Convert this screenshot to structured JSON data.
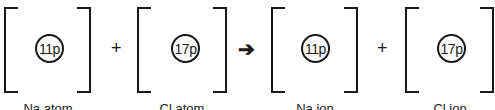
{
  "diagram": {
    "species": [
      {
        "id": "na-atom",
        "nucleus": "11p",
        "label": "Na atom"
      },
      {
        "id": "cl-atom",
        "nucleus": "17p",
        "label": "Cl atom"
      },
      {
        "id": "na-ion",
        "nucleus": "11p",
        "label": "Na ion"
      },
      {
        "id": "cl-ion",
        "nucleus": "17p",
        "label": "Cl ion"
      }
    ],
    "operators": {
      "plus": "+",
      "arrow": "➔"
    }
  }
}
